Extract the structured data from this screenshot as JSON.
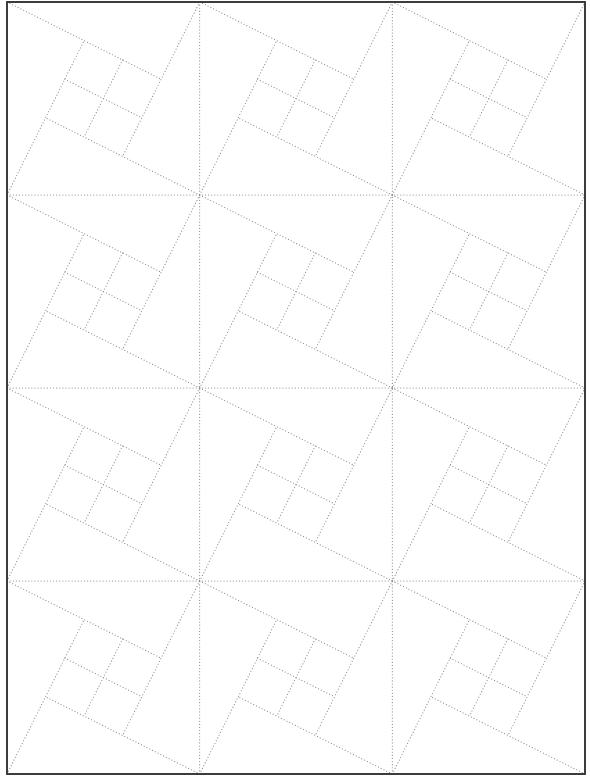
{
  "page": {
    "width": 590,
    "height": 781,
    "background": "#ffffff"
  },
  "frame": {
    "x": 7,
    "y": 2,
    "width": 578,
    "height": 772,
    "stroke": "#3c3c3c",
    "stroke_width": 2
  },
  "grid": {
    "columns": 3,
    "rows": 4,
    "line_color": "#8a8a8a",
    "line_width": 1.1,
    "dash": "0.1 3"
  },
  "block_pattern": {
    "name": "pinwheel-square-block",
    "description": "Dotted quilt-style block: tilted square with four-quadrant cross, each square edge extended to a cell corner",
    "units": "fraction-of-cell",
    "square_corners": {
      "tl": [
        0.4,
        0.2
      ],
      "tr": [
        0.8,
        0.4
      ],
      "br": [
        0.6,
        0.8
      ],
      "bl": [
        0.2,
        0.6
      ]
    },
    "lines": [
      {
        "name": "top-edge-extended",
        "from": [
          0,
          0
        ],
        "to": [
          0.8,
          0.4
        ]
      },
      {
        "name": "right-edge-extended",
        "from": [
          1,
          0
        ],
        "to": [
          0.6,
          0.8
        ]
      },
      {
        "name": "bottom-edge-extended",
        "from": [
          1,
          1
        ],
        "to": [
          0.2,
          0.6
        ]
      },
      {
        "name": "left-edge-extended",
        "from": [
          0,
          1
        ],
        "to": [
          0.4,
          0.2
        ]
      },
      {
        "name": "cross-line-a",
        "from": [
          0.3,
          0.4
        ],
        "to": [
          0.7,
          0.6
        ]
      },
      {
        "name": "cross-line-b",
        "from": [
          0.6,
          0.3
        ],
        "to": [
          0.4,
          0.7
        ]
      }
    ]
  }
}
